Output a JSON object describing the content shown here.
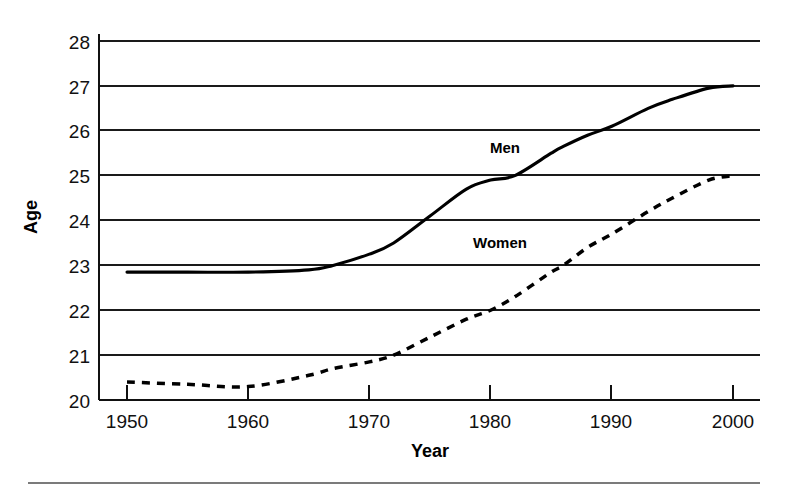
{
  "chart_data": {
    "type": "line",
    "title": "",
    "xlabel": "Year",
    "ylabel": "Age",
    "xlim": [
      1950,
      2000
    ],
    "ylim": [
      20,
      28
    ],
    "grid": true,
    "legend_position": "inline-labels",
    "x_ticks": [
      "1950",
      "1960",
      "1970",
      "1980",
      "1990",
      "2000"
    ],
    "x_tick_values": [
      1950,
      1960,
      1970,
      1980,
      1990,
      2000
    ],
    "y_ticks": [
      "20",
      "21",
      "22",
      "23",
      "24",
      "25",
      "26",
      "27",
      "28"
    ],
    "y_tick_values": [
      20,
      21,
      22,
      23,
      24,
      25,
      26,
      27,
      28
    ],
    "x": [
      1950,
      1955,
      1960,
      1965,
      1967,
      1970,
      1972,
      1975,
      1978,
      1980,
      1982,
      1985,
      1986,
      1988,
      1990,
      1993,
      1995,
      1998,
      2000
    ],
    "series": [
      {
        "name": "Men",
        "label": "Men",
        "style": "solid",
        "values": [
          22.85,
          22.85,
          22.85,
          22.9,
          23.0,
          23.25,
          23.5,
          24.1,
          24.7,
          24.9,
          25.0,
          25.5,
          25.65,
          25.9,
          26.1,
          26.5,
          26.7,
          26.95,
          27.0
        ]
      },
      {
        "name": "Women",
        "label": "Women",
        "style": "dashed",
        "values": [
          20.4,
          20.35,
          20.3,
          20.55,
          20.7,
          20.85,
          21.0,
          21.4,
          21.8,
          22.0,
          22.3,
          22.85,
          23.0,
          23.4,
          23.7,
          24.2,
          24.5,
          24.9,
          25.0
        ]
      }
    ],
    "annotations": [
      {
        "text": "Men",
        "x": 1980,
        "y": 25.75
      },
      {
        "text": "Women",
        "x": 1980,
        "y": 23.4
      }
    ]
  },
  "figure": {
    "y_axis_title": "Age",
    "x_axis_title": "Year",
    "men_label": "Men",
    "women_label": "Women",
    "colors": {
      "series": "#000000",
      "gridline": "#1a1a1a",
      "axis": "#111111",
      "background": "#ffffff",
      "footer_rule": "#7b7b7b"
    }
  }
}
